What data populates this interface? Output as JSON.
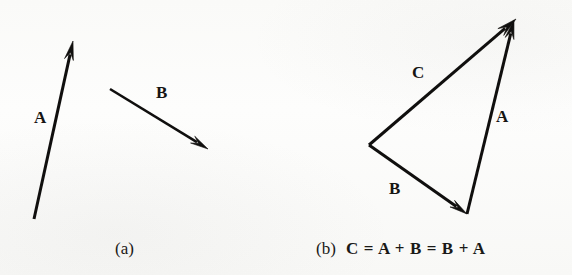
{
  "figure": {
    "background_color": "#fdfdfc",
    "ink_color": "#100f0e"
  },
  "panels": [
    {
      "id": "a",
      "caption_tag": "(a)",
      "caption_equation": "",
      "caption_full": "(a)",
      "caption_x": 115,
      "caption_y": 240,
      "vectors": [
        {
          "name": "A",
          "label": "A",
          "label_x": 34,
          "label_y": 109,
          "tail_x": 34,
          "tail_y": 219,
          "tip_x": 73,
          "tip_y": 41,
          "stroke_width": 3.0,
          "head_length": 19,
          "head_width": 9
        },
        {
          "name": "B",
          "label": "B",
          "label_x": 156,
          "label_y": 84,
          "tail_x": 110,
          "tail_y": 89,
          "tip_x": 208,
          "tip_y": 149,
          "stroke_width": 2.6,
          "head_length": 18,
          "head_width": 8
        }
      ]
    },
    {
      "id": "b",
      "caption_tag": "(b)",
      "caption_equation": "C = A + B = B + A",
      "caption_full": "(b) C = A + B = B + A",
      "caption_x": 316,
      "caption_y": 240,
      "vectors": [
        {
          "name": "B",
          "label": "B",
          "label_x": 389,
          "label_y": 180,
          "tail_x": 369,
          "tail_y": 145,
          "tip_x": 467,
          "tip_y": 214,
          "stroke_width": 3.0,
          "head_length": 18,
          "head_width": 8
        },
        {
          "name": "A",
          "label": "A",
          "label_x": 496,
          "label_y": 108,
          "tail_x": 467,
          "tail_y": 214,
          "tip_x": 514,
          "tip_y": 20,
          "stroke_width": 3.0,
          "head_length": 19,
          "head_width": 9
        },
        {
          "name": "C",
          "label": "C",
          "label_x": 412,
          "label_y": 64,
          "tail_x": 369,
          "tail_y": 145,
          "tip_x": 516,
          "tip_y": 19,
          "stroke_width": 3.0,
          "head_length": 20,
          "head_width": 9
        }
      ]
    }
  ]
}
